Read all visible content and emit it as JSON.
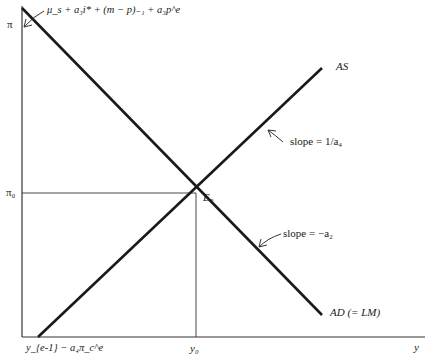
{
  "axes": {
    "y_axis_label": "π",
    "x_axis_label": "y",
    "pi0_label": "π₀",
    "y0_label": "y₀",
    "x_intercept_label": "y_{e-1} − a₄π_c^e"
  },
  "curves": {
    "as_label": "AS",
    "ad_label": "AD (= LM)"
  },
  "annotations": {
    "intercept_formula": "μ_s + a₃i* + (m − p)₋₁ + a₃p^e",
    "as_slope": "slope = 1/a₄",
    "ad_slope": "slope = −a₂",
    "equilibrium": "E₀"
  },
  "colors": {
    "line": "#1a1a1a",
    "axis": "#333333",
    "background": "#ffffff"
  }
}
